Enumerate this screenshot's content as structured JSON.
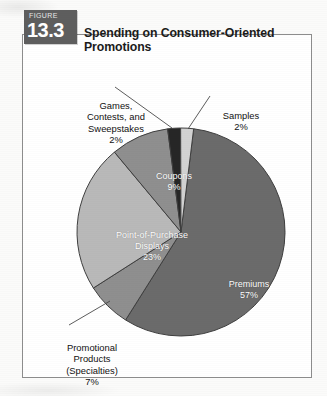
{
  "figure": {
    "kicker": "FIGURE",
    "number": "13.3",
    "title": "Spending on Consumer-Oriented Promotions"
  },
  "colors": {
    "premiums": "#6b6b6b",
    "point_of_purchase": "#b9b9b9",
    "coupons": "#8f8f8f",
    "games": "#262626",
    "samples": "#d2d2d2",
    "tab_background": "#5e5e5e",
    "frame_border": "#8d8d8d",
    "slice_outline": "#3a3a3a",
    "label_text": "#111111",
    "inner_label_text": "#ffffff"
  },
  "labels": {
    "premiums": {
      "name": "Premiums",
      "pct": "57%"
    },
    "point_of_purchase": {
      "line1": "Point-of-Purchase",
      "line2": "Displays",
      "pct": "23%"
    },
    "coupons": {
      "name": "Coupons",
      "pct": "9%"
    },
    "games": {
      "line1": "Games,",
      "line2": "Contests, and",
      "line3": "Sweepstakes",
      "pct": "2%"
    },
    "samples": {
      "name": "Samples",
      "pct": "2%"
    },
    "promotional": {
      "line1": "Promotional",
      "line2": "Products",
      "line3": "(Specialties)",
      "pct": "7%"
    }
  },
  "chart_data": {
    "type": "pie",
    "title": "Spending on Consumer-Oriented Promotions",
    "subtitle": "",
    "xlabel": "",
    "ylabel": "",
    "grid": false,
    "legend_position": "none",
    "total": "100%",
    "units": "percent of spending",
    "categories": [
      "Premiums",
      "Point-of-Purchase Displays",
      "Promotional Products (Specialties)",
      "Coupons",
      "Games, Contests, and Sweepstakes",
      "Samples"
    ],
    "values": [
      57,
      23,
      7,
      9,
      2,
      2
    ],
    "slices": [
      {
        "label": "Premiums",
        "value": 57,
        "value_text": "57%",
        "color": "#6b6b6b",
        "label_placement": "inside"
      },
      {
        "label": "Point-of-Purchase Displays",
        "value": 23,
        "value_text": "23%",
        "color": "#b9b9b9",
        "label_placement": "inside"
      },
      {
        "label": "Promotional Products (Specialties)",
        "value": 7,
        "value_text": "7%",
        "color": "#8f8f8f",
        "label_placement": "outside-leader"
      },
      {
        "label": "Coupons",
        "value": 9,
        "value_text": "9%",
        "color": "#8f8f8f",
        "label_placement": "inside"
      },
      {
        "label": "Games, Contests, and Sweepstakes",
        "value": 2,
        "value_text": "2%",
        "color": "#262626",
        "label_placement": "outside-leader"
      },
      {
        "label": "Samples",
        "value": 2,
        "value_text": "2%",
        "color": "#d2d2d2",
        "label_placement": "outside-leader"
      }
    ]
  }
}
